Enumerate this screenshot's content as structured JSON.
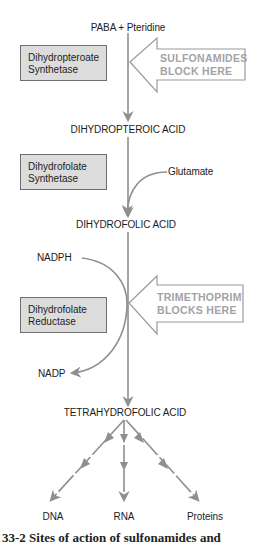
{
  "diagram": {
    "start": "PABA + Pteridine",
    "intermediates": {
      "dihydropteroic": "DIHYDROPTEROIC ACID",
      "dihydrofolic": "DIHYDROFOLIC ACID",
      "tetrahydrofolic": "TETRAHYDROFOLIC ACID"
    },
    "enzymes": [
      {
        "line1": "Dihydropteroate",
        "line2": "Synthetase"
      },
      {
        "line1": "Dihydrofolate",
        "line2": "Synthetase"
      },
      {
        "line1": "Dihydrofolate",
        "line2": "Reductase"
      }
    ],
    "cofactors": {
      "glutamate": "Glutamate",
      "nadph": "NADPH",
      "nadp": "NADP"
    },
    "blocks": [
      {
        "line1": "SULFONAMIDES",
        "line2": "BLOCK HERE"
      },
      {
        "line1": "TRIMETHOPRIM",
        "line2": "BLOCKS HERE"
      }
    ],
    "products": [
      "DNA",
      "RNA",
      "Proteins"
    ],
    "caption_partial": "33-2 Sites of action of sulfonamides and"
  },
  "colors": {
    "line": "#8f8f8f",
    "box_fill": "#dcdcdc",
    "box_border": "#6e6e6e",
    "block_text": "#a3a3a3",
    "block_outline": "#9a9a9a"
  }
}
